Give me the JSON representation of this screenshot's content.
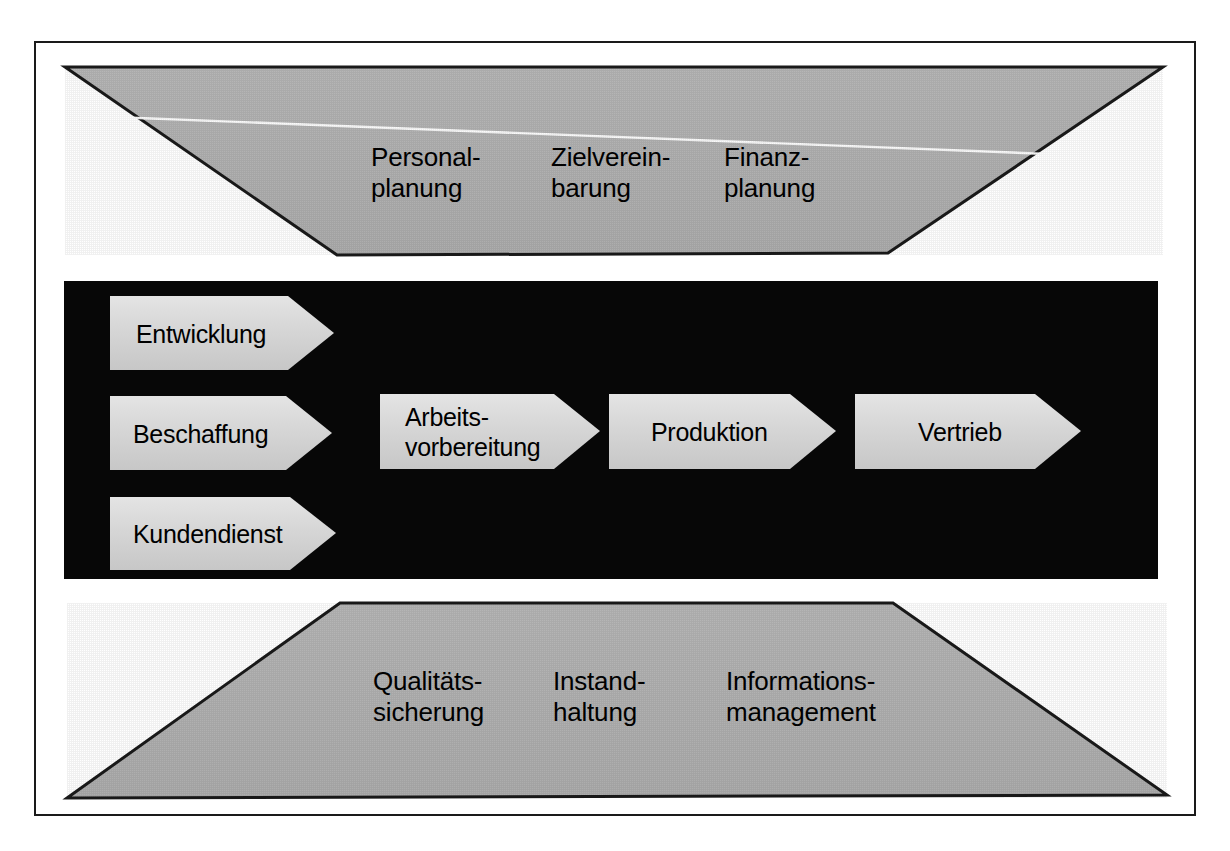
{
  "diagram": {
    "type": "process-model",
    "background": "#ffffff",
    "frame_color": "#1a1a1a",
    "band_fill": "#b3b3b3",
    "core_fill": "#050505",
    "arrow_fill": "#d4d4d4",
    "highlight_line": "#ffffff"
  },
  "top_band": {
    "name": "management-processes-band",
    "shape": "trapezoid-inverted",
    "items": [
      {
        "id": "personalplanung",
        "label": "Personal-\nplanung"
      },
      {
        "id": "zielvereinbarung",
        "label": "Zielverein-\nbarung"
      },
      {
        "id": "finanzplanung",
        "label": "Finanz-\nplanung"
      }
    ]
  },
  "core_band": {
    "name": "core-process-band",
    "inputs": [
      {
        "id": "entwicklung",
        "label": "Entwicklung"
      },
      {
        "id": "beschaffung",
        "label": "Beschaffung"
      },
      {
        "id": "kundendienst",
        "label": "Kundendienst"
      }
    ],
    "chain": [
      {
        "id": "arbeitsvorbereitung",
        "label": "Arbeits-\nvorbereitung"
      },
      {
        "id": "produktion",
        "label": "Produktion"
      },
      {
        "id": "vertrieb",
        "label": "Vertrieb"
      }
    ]
  },
  "bottom_band": {
    "name": "support-processes-band",
    "shape": "trapezoid-upright",
    "items": [
      {
        "id": "qualitaetssicherung",
        "label": "Qualitäts-\nsicherung"
      },
      {
        "id": "instandhaltung",
        "label": "Instand-\nhaltung"
      },
      {
        "id": "informationsmanagement",
        "label": "Informations-\nmanagement"
      }
    ]
  }
}
